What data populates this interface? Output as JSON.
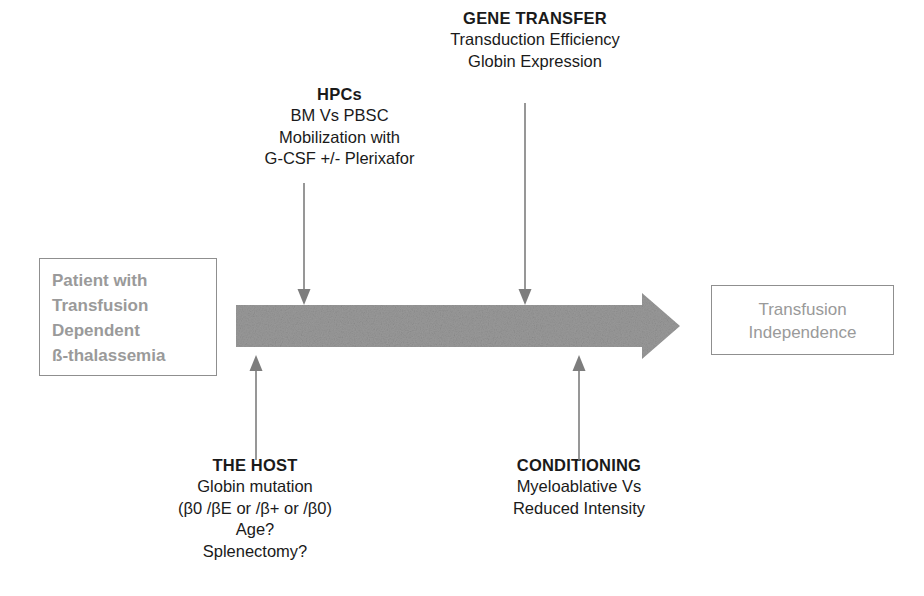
{
  "figure": {
    "background_color": "#ffffff",
    "arrow_color": "#9a9a9a",
    "box_border_color": "#8f8f8f",
    "box_text_color": "#9a9a9a",
    "text_color": "#1a1a1a"
  },
  "annotations": {
    "gene_transfer": {
      "heading": "GENE TRANSFER",
      "lines": [
        "Transduction Efficiency",
        "Globin Expression"
      ]
    },
    "hpcs": {
      "heading": "HPCs",
      "lines": [
        "BM Vs PBSC",
        "Mobilization with",
        "G-CSF +/- Plerixafor"
      ]
    },
    "the_host": {
      "heading": "THE HOST",
      "lines": [
        "Globin mutation",
        "(β0 /βE or /β+ or  /β0)",
        "Age?",
        "Splenectomy?"
      ]
    },
    "conditioning": {
      "heading": "CONDITIONING",
      "lines": [
        "Myeloablative Vs",
        "Reduced Intensity"
      ]
    }
  },
  "boxes": {
    "patient": {
      "lines": [
        "Patient with",
        "Transfusion",
        "Dependent",
        "ß-thalassemia"
      ]
    },
    "independence": {
      "lines": [
        "Transfusion",
        "Independence"
      ]
    }
  },
  "icons": {
    "main_arrow": "right-block-arrow",
    "down_arrow_hpcs": "down-arrow",
    "down_arrow_gene_transfer": "down-arrow",
    "up_arrow_the_host": "up-arrow",
    "up_arrow_conditioning": "up-arrow"
  }
}
